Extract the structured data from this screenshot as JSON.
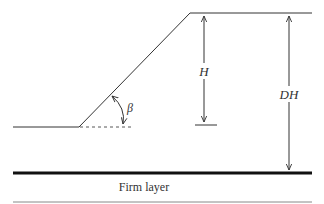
{
  "diagram": {
    "labels": {
      "height": "H",
      "depth": "DH",
      "angle": "β",
      "firm_layer": "Firm layer"
    },
    "colors": {
      "line": "#333333",
      "thick_line": "#111111",
      "bottom_line": "#888888"
    }
  }
}
